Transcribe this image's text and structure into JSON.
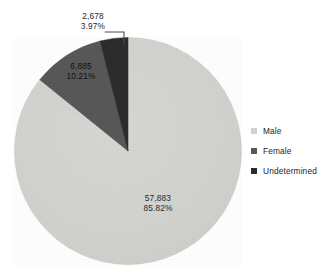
{
  "chart_data": {
    "type": "pie",
    "title": "",
    "subtitle": "",
    "xlabel": "",
    "ylabel": "",
    "grid": false,
    "legend_position": "right",
    "total": 67446,
    "start_angle_deg": 0,
    "direction": "clockwise",
    "categories": [
      "Male",
      "Female",
      "Undetermined"
    ],
    "values": [
      57883,
      6885,
      2678
    ],
    "percentages": [
      85.82,
      10.21,
      3.97
    ],
    "colors": [
      "#d2d2cf",
      "#575757",
      "#2b2b2b"
    ],
    "slices": [
      {
        "name": "Male",
        "value": 57883,
        "value_label": "57,883",
        "percent": 85.82,
        "percent_label": "85.82%",
        "color": "#d2d2cf",
        "label_placement": "inside"
      },
      {
        "name": "Female",
        "value": 6885,
        "value_label": "6,885",
        "percent": 10.21,
        "percent_label": "10.21%",
        "color": "#575757",
        "label_placement": "inside"
      },
      {
        "name": "Undetermined",
        "value": 2678,
        "value_label": "2,678",
        "percent": 3.97,
        "percent_label": "3.97%",
        "color": "#2b2b2b",
        "label_placement": "outside-leader"
      }
    ]
  },
  "labels": {
    "male": {
      "value": "57,883",
      "percent": "85.82%"
    },
    "female": {
      "value": "6,885",
      "percent": "10.21%"
    },
    "undetermined": {
      "value": "2,678",
      "percent": "3.97%"
    }
  },
  "legend": {
    "items": [
      {
        "label": "Male",
        "color": "#d2d2cf"
      },
      {
        "label": "Female",
        "color": "#575757"
      },
      {
        "label": "Undetermined",
        "color": "#2b2b2b"
      }
    ]
  }
}
